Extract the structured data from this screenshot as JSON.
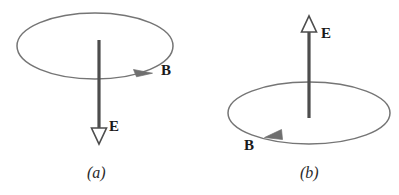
{
  "figure": {
    "type": "physics-diagram",
    "background_color": "#ffffff",
    "line_color": "#6f6f6f",
    "arrow_color": "#4d4d4d",
    "text_color": "#1a1a1a",
    "panels": [
      {
        "id": "a",
        "caption_open": "(",
        "caption_letter": "a",
        "caption_close": ")",
        "caption": "(a)",
        "loop": {
          "name": "circular-loop",
          "center_x": 95,
          "center_y": 46,
          "radius_x": 78,
          "radius_y": 33,
          "circulation": "clockwise-viewed-from-above"
        },
        "field_vector": {
          "symbol": "E",
          "label": "E",
          "direction": "down",
          "x": 99,
          "y_start": 40,
          "y_end": 145,
          "arrowhead": "hollow",
          "label_x": 110,
          "label_y": 131
        },
        "circulation_vector": {
          "symbol": "B",
          "label": "B",
          "direction": "clockwise",
          "arrowhead": "solid",
          "arrow_x": 148,
          "arrow_y": 71,
          "label_x": 163,
          "label_y": 75
        }
      },
      {
        "id": "b",
        "caption_open": "(",
        "caption_letter": "b",
        "caption_close": ")",
        "caption": "(b)",
        "loop": {
          "name": "circular-loop",
          "center_x": 309,
          "center_y": 113,
          "radius_x": 81,
          "radius_y": 31,
          "circulation": "counterclockwise-viewed-from-above"
        },
        "field_vector": {
          "symbol": "E",
          "label": "E",
          "direction": "up",
          "x": 309,
          "y_start": 118,
          "y_end": 17,
          "arrowhead": "hollow",
          "label_x": 322,
          "label_y": 38
        },
        "circulation_vector": {
          "symbol": "B",
          "label": "B",
          "direction": "counterclockwise",
          "arrowhead": "solid",
          "arrow_x": 272,
          "arrow_y": 136,
          "label_x": 245,
          "label_y": 150
        }
      }
    ]
  }
}
